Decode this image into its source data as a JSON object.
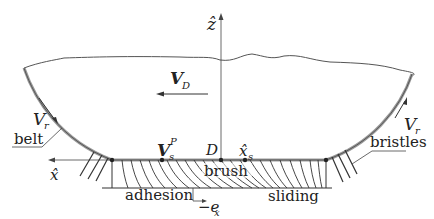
{
  "diagram": {
    "type": "brush tire contact model",
    "axes": {
      "z_label": "ẑ",
      "x_label": "x̂"
    },
    "labels": {
      "velocity_D_main": "V",
      "velocity_D_sub": "D",
      "vr_left_main": "V",
      "vr_left_sub": "r",
      "vr_right_main": "V",
      "vr_right_sub": "r",
      "belt": "belt",
      "bristles": "bristles",
      "vsp_main": "V",
      "vsp_sub": "s",
      "vsp_sup": "P",
      "point_D": "D",
      "xs_main": "x̂",
      "xs_sub": "s",
      "brush": "brush",
      "adhesion": "adhesion",
      "sliding": "sliding",
      "ex_main": "−e",
      "ex_sub": "x"
    },
    "colors": {
      "stroke": "#333333",
      "belt": "#888888",
      "background": "#ffffff"
    }
  }
}
